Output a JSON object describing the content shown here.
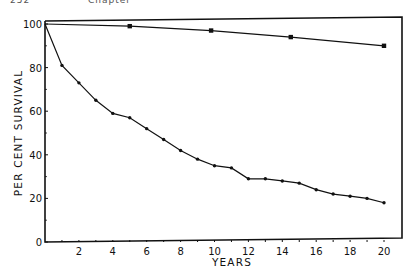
{
  "page_header": {
    "page_number": "252",
    "section": "Chapter"
  },
  "chart_data": {
    "type": "line",
    "title": "",
    "xlabel": "YEARS",
    "ylabel": "PER CENT SURVIVAL",
    "xlim": [
      0,
      20
    ],
    "ylim": [
      0,
      100
    ],
    "x_ticks": [
      2,
      4,
      6,
      8,
      10,
      12,
      14,
      16,
      18,
      20
    ],
    "y_ticks": [
      0,
      20,
      40,
      60,
      80,
      100
    ],
    "grid": false,
    "legend": "none",
    "frame": "top and right borders drawn",
    "series": [
      {
        "name": "upper curve (cross markers)",
        "marker": "x",
        "x": [
          0,
          5,
          9.8,
          14.5,
          20
        ],
        "y": [
          100,
          99,
          97,
          94,
          90
        ]
      },
      {
        "name": "lower curve (dot markers)",
        "marker": "dot",
        "x": [
          0,
          1,
          2,
          3,
          4,
          5,
          6,
          7,
          8,
          9,
          10,
          11,
          12,
          13,
          14,
          15,
          16,
          17,
          18,
          19,
          20
        ],
        "y": [
          100,
          81,
          73,
          65,
          59,
          57,
          52,
          47,
          42,
          38,
          35,
          34,
          29,
          29,
          28,
          27,
          24,
          22,
          21,
          20,
          18
        ]
      }
    ]
  },
  "colors": {
    "ink": "#111111",
    "paper": "#ffffff"
  }
}
